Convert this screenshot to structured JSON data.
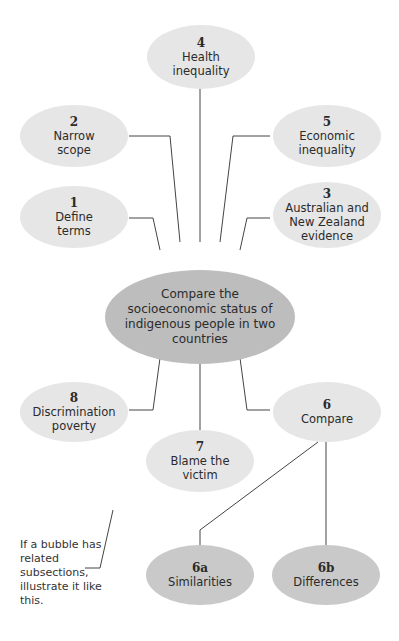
{
  "center": {
    "text": "Compare the socioeconomic status of indigenous people in two countries"
  },
  "bubbles": [
    {
      "num": "4",
      "text": "Health inequality"
    },
    {
      "num": "2",
      "text": "Narrow scope"
    },
    {
      "num": "5",
      "text": "Economic inequality"
    },
    {
      "num": "1",
      "text": "Define terms"
    },
    {
      "num": "3",
      "text": "Australian and New Zealand evidence"
    },
    {
      "num": "8",
      "text": "Discrimination poverty"
    },
    {
      "num": "6",
      "text": "Compare"
    },
    {
      "num": "7",
      "text": "Blame the victim"
    },
    {
      "num": "6a",
      "text": "Similarities"
    },
    {
      "num": "6b",
      "text": "Differences"
    }
  ],
  "note": "If a bubble has related subsections, illustrate it like this."
}
